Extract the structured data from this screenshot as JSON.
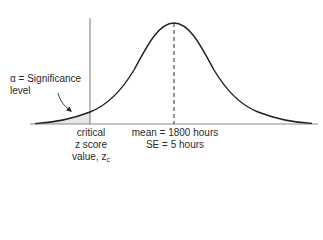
{
  "diagram": {
    "type": "normal-distribution",
    "alpha_label": {
      "line1": "α = Significance",
      "line2": "level"
    },
    "critical_label": {
      "line1": "critical",
      "line2": "z score",
      "line3_prefix": "value, z",
      "line3_sub": "c"
    },
    "mean_label": {
      "line1": "mean = 1800 hours",
      "line2": "SE = 5 hours"
    },
    "colors": {
      "curve": "#1e1e1e",
      "axis": "#8a8a8a",
      "shade": "#e6e6e6",
      "text": "#2a2a2a"
    }
  }
}
